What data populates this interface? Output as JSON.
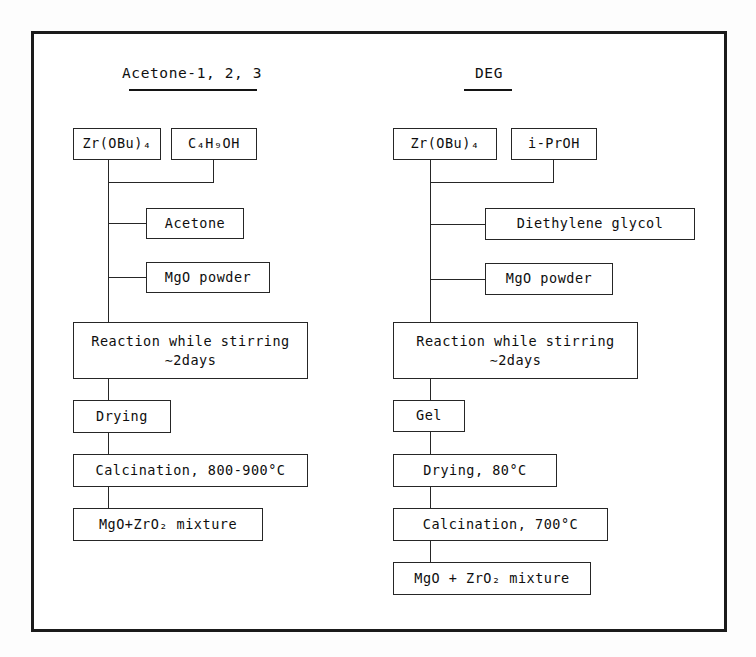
{
  "figure": {
    "title_left": "Acetone-1, 2, 3",
    "title_right": "DEG"
  },
  "columns": [
    {
      "id": "acetone",
      "heading": "Acetone-1, 2, 3",
      "precursor": "Zr(OBu)₄",
      "solvent": "C₄H₉OH",
      "additives": [
        "Acetone",
        "MgO powder"
      ],
      "steps": [
        "Reaction while stirring\n∼2days",
        "Drying",
        "Calcination, 800-900°C",
        "MgO+ZrO₂ mixture"
      ]
    },
    {
      "id": "deg",
      "heading": "DEG",
      "precursor": "Zr(OBu)₄",
      "solvent": "i-PrOH",
      "additives": [
        "Diethylene glycol",
        "MgO powder"
      ],
      "steps": [
        "Reaction while stirring\n∼2days",
        "Gel",
        "Drying, 80°C",
        "Calcination, 700°C",
        "MgO + ZrO₂ mixture"
      ]
    }
  ],
  "nodes": {
    "l_zr": "Zr(OBu)₄",
    "l_buoh": "C₄H₉OH",
    "l_acetone": "Acetone",
    "l_mgo": "MgO powder",
    "l_reaction": "Reaction while stirring\n∼2days",
    "l_drying": "Drying",
    "l_calcination": "Calcination, 800-900°C",
    "l_product": "MgO+ZrO₂ mixture",
    "r_zr": "Zr(OBu)₄",
    "r_proh": "i-PrOH",
    "r_deg": "Diethylene glycol",
    "r_mgo": "MgO powder",
    "r_reaction": "Reaction while stirring\n∼2days",
    "r_gel": "Gel",
    "r_drying": "Drying, 80°C",
    "r_calcination": "Calcination, 700°C",
    "r_product": "MgO + ZrO₂ mixture"
  },
  "colors": {
    "ink": "#1b1b1b",
    "box_border": "#262626",
    "paper": "#ffffff"
  }
}
